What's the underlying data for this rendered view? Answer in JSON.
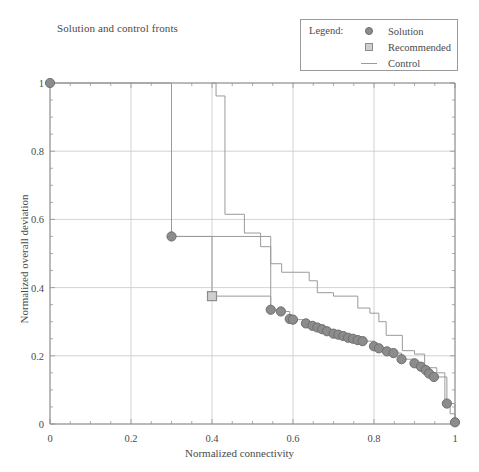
{
  "figure": {
    "title": "Solution and control fronts",
    "width": 479,
    "height": 472
  },
  "legend": {
    "heading": "Legend:",
    "entries": [
      {
        "label": "Solution",
        "marker": "circle-marker-icon",
        "color": "#8c8c8c"
      },
      {
        "label": "Recommended",
        "marker": "square-marker-icon",
        "color": "#cfcfcf"
      },
      {
        "label": "Control",
        "marker": "line-marker-icon",
        "color": "#9a9a9a"
      }
    ]
  },
  "axes": {
    "x_tick_labels": [
      "0",
      "0.2",
      "0.4",
      "0.6",
      "0.8",
      "1"
    ],
    "y_tick_labels": [
      "0",
      "0.2",
      "0.4",
      "0.6",
      "0.8",
      "1"
    ]
  },
  "chart_data": {
    "type": "scatter",
    "title": "Solution and control fronts",
    "xlabel": "Normalized connectivity",
    "ylabel": "Normalized overall deviation",
    "xlim": [
      0,
      1
    ],
    "ylim": [
      0,
      1
    ],
    "xticks": [
      0,
      0.2,
      0.4,
      0.6,
      0.8,
      1
    ],
    "yticks": [
      0,
      0.2,
      0.4,
      0.6,
      0.8,
      1
    ],
    "grid": true,
    "minor_ticks": true,
    "legend_position": "top-right",
    "colors": {
      "solution": "#8c8c8c",
      "solution_edge": "#6f6f6f",
      "recommended_fill": "#cfcfcf",
      "recommended_edge": "#8c8c8c",
      "control": "#9a9a9a",
      "grid": "#c8c8c8",
      "axis": "#8a8a8a",
      "text": "#4a4a4a"
    },
    "series": [
      {
        "name": "Solution",
        "type": "scatter-with-step-line",
        "marker": "circle",
        "points": [
          [
            0.0,
            1.0
          ],
          [
            0.3,
            0.55
          ],
          [
            0.545,
            0.335
          ],
          [
            0.57,
            0.33
          ],
          [
            0.592,
            0.308
          ],
          [
            0.6,
            0.306
          ],
          [
            0.632,
            0.295
          ],
          [
            0.648,
            0.288
          ],
          [
            0.66,
            0.283
          ],
          [
            0.672,
            0.278
          ],
          [
            0.684,
            0.272
          ],
          [
            0.7,
            0.265
          ],
          [
            0.712,
            0.262
          ],
          [
            0.724,
            0.258
          ],
          [
            0.736,
            0.253
          ],
          [
            0.748,
            0.25
          ],
          [
            0.76,
            0.246
          ],
          [
            0.772,
            0.243
          ],
          [
            0.8,
            0.228
          ],
          [
            0.812,
            0.222
          ],
          [
            0.832,
            0.213
          ],
          [
            0.848,
            0.208
          ],
          [
            0.868,
            0.19
          ],
          [
            0.9,
            0.178
          ],
          [
            0.916,
            0.168
          ],
          [
            0.928,
            0.158
          ],
          [
            0.936,
            0.148
          ],
          [
            0.948,
            0.138
          ],
          [
            0.98,
            0.06
          ],
          [
            1.0,
            0.005
          ]
        ]
      },
      {
        "name": "Recommended",
        "type": "scatter",
        "marker": "square",
        "points": [
          [
            0.4,
            0.375
          ]
        ]
      },
      {
        "name": "Control",
        "type": "step",
        "points": [
          [
            0.4,
            1.0
          ],
          [
            0.41,
            1.0
          ],
          [
            0.41,
            0.962
          ],
          [
            0.432,
            0.962
          ],
          [
            0.432,
            0.615
          ],
          [
            0.48,
            0.615
          ],
          [
            0.48,
            0.56
          ],
          [
            0.52,
            0.56
          ],
          [
            0.52,
            0.52
          ],
          [
            0.545,
            0.52
          ],
          [
            0.545,
            0.47
          ],
          [
            0.572,
            0.47
          ],
          [
            0.572,
            0.445
          ],
          [
            0.64,
            0.445
          ],
          [
            0.64,
            0.42
          ],
          [
            0.66,
            0.42
          ],
          [
            0.66,
            0.385
          ],
          [
            0.7,
            0.385
          ],
          [
            0.7,
            0.375
          ],
          [
            0.76,
            0.375
          ],
          [
            0.76,
            0.34
          ],
          [
            0.79,
            0.34
          ],
          [
            0.79,
            0.325
          ],
          [
            0.812,
            0.325
          ],
          [
            0.812,
            0.3
          ],
          [
            0.83,
            0.3
          ],
          [
            0.83,
            0.26
          ],
          [
            0.87,
            0.26
          ],
          [
            0.87,
            0.215
          ],
          [
            0.9,
            0.215
          ],
          [
            0.9,
            0.205
          ],
          [
            0.925,
            0.205
          ],
          [
            0.925,
            0.165
          ],
          [
            0.955,
            0.165
          ],
          [
            0.955,
            0.15
          ],
          [
            0.975,
            0.15
          ],
          [
            0.975,
            0.06
          ],
          [
            0.988,
            0.06
          ],
          [
            0.988,
            0.03
          ],
          [
            1.0,
            0.03
          ],
          [
            1.0,
            0.0
          ]
        ]
      }
    ],
    "control_prefix": {
      "comment": "segment from (0,1) across top then vertical at x=0.30, horizontal to 0.40, vertical to 0.375, horizontal to 0.545",
      "points": [
        [
          0.0,
          1.0
        ],
        [
          0.3,
          1.0
        ],
        [
          0.3,
          0.55
        ],
        [
          0.4,
          0.55
        ],
        [
          0.4,
          0.375
        ],
        [
          0.545,
          0.375
        ],
        [
          0.545,
          0.335
        ]
      ]
    }
  }
}
